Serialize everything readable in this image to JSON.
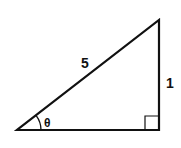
{
  "diagram": {
    "type": "right-triangle",
    "hypotenuse_label": "5",
    "opposite_label": "1",
    "angle_label": "θ",
    "right_angle_marker": true,
    "stroke_color": "#111111"
  }
}
